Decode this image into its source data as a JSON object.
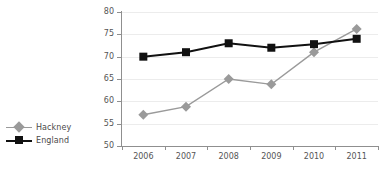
{
  "chart_data": {
    "type": "line",
    "title": "",
    "xlabel": "",
    "ylabel": "",
    "categories": [
      "2006",
      "2007",
      "2008",
      "2009",
      "2010",
      "2011"
    ],
    "ylim": [
      50,
      80
    ],
    "yticks": [
      50,
      55,
      60,
      65,
      70,
      75,
      80
    ],
    "grid": true,
    "legend_position": "left",
    "series": [
      {
        "name": "Hackney",
        "color": "#9a9a9a",
        "marker": "diamond",
        "values": [
          57,
          58.8,
          65,
          63.8,
          71,
          76.2
        ]
      },
      {
        "name": "England",
        "color": "#111111",
        "marker": "square",
        "values": [
          70,
          71,
          73,
          72,
          72.8,
          74
        ]
      }
    ]
  },
  "legend": {
    "items": [
      {
        "label": "Hackney",
        "marker": "diamond-marker",
        "color": "#9a9a9a"
      },
      {
        "label": "England",
        "marker": "square-marker",
        "color": "#111111"
      }
    ]
  },
  "axes": {
    "y_tick_labels": [
      "80",
      "75",
      "70",
      "65",
      "60",
      "55",
      "50"
    ],
    "x_tick_labels": [
      "2006",
      "2007",
      "2008",
      "2009",
      "2010",
      "2011"
    ]
  }
}
